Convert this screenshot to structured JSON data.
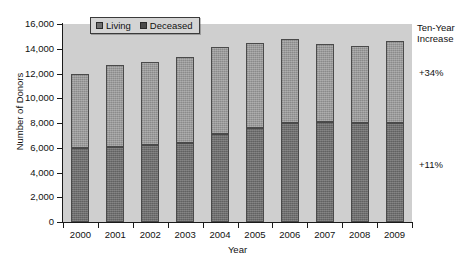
{
  "chart_data": {
    "type": "bar",
    "stacked": true,
    "title": "",
    "xlabel": "Year",
    "ylabel": "Number of Donors",
    "categories": [
      "2000",
      "2001",
      "2002",
      "2003",
      "2004",
      "2005",
      "2006",
      "2007",
      "2008",
      "2009"
    ],
    "series": [
      {
        "name": "Deceased",
        "values": [
          5950,
          6100,
          6200,
          6400,
          7150,
          7600,
          8000,
          8100,
          8000,
          8000
        ]
      },
      {
        "name": "Living",
        "values": [
          6000,
          6600,
          6700,
          6900,
          7000,
          6900,
          6750,
          6300,
          6200,
          6600
        ]
      }
    ],
    "totals": [
      11950,
      12700,
      12900,
      13300,
      14150,
      14500,
      14750,
      14400,
      14200,
      14600
    ],
    "ylim": [
      0,
      16000
    ],
    "ytick_step": 2000,
    "ytick_labels": [
      "16,000",
      "14,000",
      "12,000",
      "10,000",
      "8,000",
      "6,000",
      "4,000",
      "2,000",
      "0"
    ],
    "ytick_values": [
      16000,
      14000,
      12000,
      10000,
      8000,
      6000,
      4000,
      2000,
      0
    ],
    "grid": false,
    "legend_position": "top-left-inside",
    "plot_background": "#cfcfcf",
    "colors": {
      "living": "#9a9a9a",
      "deceased": "#6e6e6e",
      "axis": "#1a1a1a",
      "bar_outline": "#4a4a4a"
    },
    "annotations": [
      {
        "name": "ten-year-increase-heading",
        "lines": [
          "Ten-Year",
          "Increase"
        ]
      },
      {
        "name": "living-increase",
        "text": "+34%"
      },
      {
        "name": "deceased-increase",
        "text": "+11%"
      }
    ]
  },
  "legend": {
    "items": [
      {
        "label": "Living",
        "swatch": "legend-swatch-living"
      },
      {
        "label": "Deceased",
        "swatch": "legend-swatch-deceased"
      }
    ]
  },
  "axes": {
    "y_title": "Number of Donors",
    "x_title": "Year"
  },
  "notes": {
    "heading_line1": "Ten-Year",
    "heading_line2": "Increase",
    "top_value": "+34%",
    "bottom_value": "+11%"
  }
}
